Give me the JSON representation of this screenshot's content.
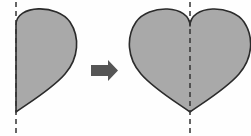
{
  "figure": {
    "title": "",
    "background_color": "#fefefe",
    "width": 251,
    "height": 136,
    "shape_fill_color": "#a9a9a9",
    "shape_outline_color": "#2b2b2b",
    "axis_line_color": "#333333",
    "arrow_color": "#555555"
  },
  "left_panel": {
    "shape_name": "half-heart",
    "axis_label": "",
    "axis_x": 16,
    "axis_y_start": 2,
    "axis_y_end": 134,
    "shape_top_y": 12,
    "shape_bottom_y": 112,
    "shape_left_x": 16,
    "shape_right_x": 77
  },
  "arrow": {
    "label": "",
    "direction": "right",
    "x": 91,
    "y": 60,
    "width": 27,
    "height": 21
  },
  "right_panel": {
    "shape_name": "full-heart",
    "axis_label": "",
    "axis_x": 190,
    "axis_y_start": 2,
    "axis_y_end": 134,
    "shape_top_y": 12,
    "shape_notch_y": 26,
    "shape_bottom_y": 112,
    "shape_left_x": 134,
    "shape_right_x": 246
  }
}
